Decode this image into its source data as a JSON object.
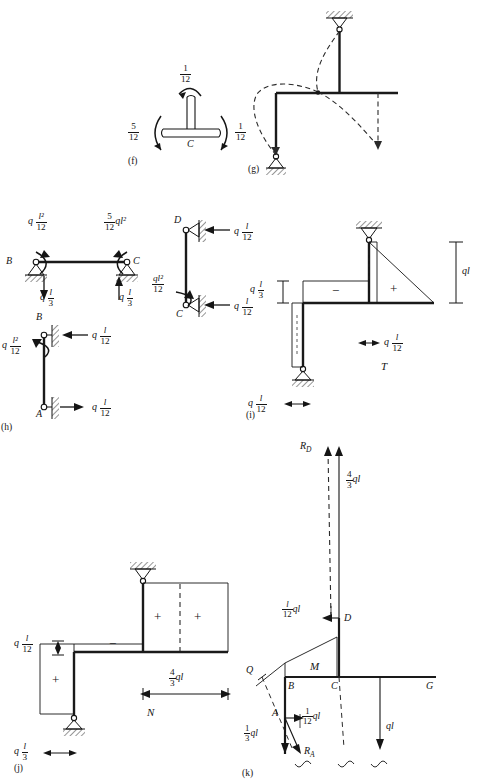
{
  "figure": {
    "type": "structural-analysis-plate"
  },
  "panels": {
    "f": {
      "id": "(f)",
      "joint_label": "C",
      "moment_top": {
        "num": "1",
        "den": "12"
      },
      "moment_left": {
        "num": "5",
        "den": "12"
      },
      "moment_right": {
        "num": "1",
        "den": "12"
      }
    },
    "g": {
      "id": "(g)",
      "caption": ""
    },
    "h": {
      "id": "(h)",
      "beam": {
        "node_left": "B",
        "node_right": "C",
        "moment_left_q": "q",
        "moment_left_frac": {
          "num": "l²",
          "den": "12"
        },
        "moment_right_frac": {
          "num": "5",
          "den": "12"
        },
        "moment_right_tail": "ql²",
        "reaction_left_q": "q",
        "reaction_left_frac": {
          "num": "l",
          "den": "3"
        },
        "reaction_right_q": "q",
        "reaction_right_frac": {
          "num": "l",
          "den": "3"
        }
      },
      "column_cd": {
        "node_top": "D",
        "node_bottom": "C",
        "force_top_q": "q",
        "force_top_frac": {
          "num": "l",
          "den": "12"
        },
        "force_bottom_q": "q",
        "force_bottom_frac": {
          "num": "l",
          "den": "12"
        },
        "moment_frac": {
          "num": "ql²",
          "den": "12"
        }
      },
      "column_ab": {
        "node_top": "B",
        "node_bottom": "A",
        "moment_q": "q",
        "moment_frac": {
          "num": "l²",
          "den": "12"
        },
        "force_top_q": "q",
        "force_top_frac": {
          "num": "l",
          "den": "12"
        },
        "force_bottom_q": "q",
        "force_bottom_frac": {
          "num": "l",
          "den": "12"
        }
      }
    },
    "i": {
      "id": "(i)",
      "diagram_name": "T",
      "sign_negative": "−",
      "sign_positive": "+",
      "dim_right": "ql",
      "dim_left_q": "q",
      "dim_left_frac": {
        "num": "l",
        "den": "3"
      },
      "dim_mid_q": "q",
      "dim_mid_frac": {
        "num": "l",
        "den": "12"
      },
      "dim_bottom_q": "q",
      "dim_bottom_frac": {
        "num": "l",
        "den": "12"
      }
    },
    "j": {
      "id": "(j)",
      "diagram_name": "N",
      "sign_negative": "−",
      "sign_positive_left": "+",
      "sign_positive_mid": "+",
      "sign_positive_right": "+",
      "dim_left_q": "q",
      "dim_left_frac": {
        "num": "l",
        "den": "12"
      },
      "dim_span_frac": {
        "num": "4",
        "den": "3"
      },
      "dim_span_tail": "ql",
      "dim_bottom_q": "q",
      "dim_bottom_frac": {
        "num": "l",
        "den": "3"
      }
    },
    "k": {
      "id": "(k)",
      "diagram_name": "M",
      "nodes": {
        "q": "Q",
        "b": "B",
        "c": "C",
        "g": "G",
        "a": "A",
        "d": "D"
      },
      "reaction_d": "R",
      "reaction_d_sub": "D",
      "reaction_a": "R",
      "reaction_a_sub": "A",
      "force_right_frac": {
        "num": "4",
        "den": "3"
      },
      "force_right_tail": "ql",
      "force_d_frac": {
        "num": "l",
        "den": "12"
      },
      "force_d_tail": "ql",
      "force_a_h_frac": {
        "num": "1",
        "den": "12"
      },
      "force_a_h_tail": "ql",
      "force_a_v_frac": {
        "num": "1",
        "den": "3"
      },
      "force_a_v_tail": "ql",
      "load_ql": "ql"
    }
  },
  "colors": {
    "ink": "#151515",
    "line": "#1a1a1a",
    "dashed": "#2a2a2a",
    "paper": "#ffffff"
  }
}
